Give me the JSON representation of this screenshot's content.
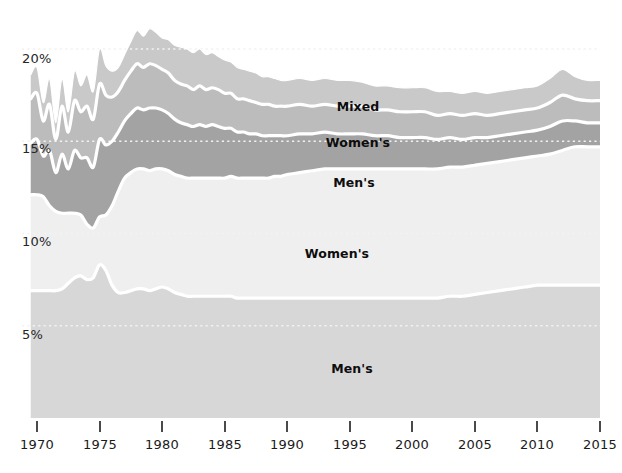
{
  "chart_data": {
    "type": "area",
    "title": "",
    "subtitle": "",
    "xlabel": "",
    "ylabel": "",
    "stacked": true,
    "grid": true,
    "legend_position": "inline-labels",
    "xlim": [
      1969,
      2016
    ],
    "ylim": [
      0,
      22
    ],
    "x_tick_labels": [
      "1970",
      "1975",
      "1980",
      "1985",
      "1990",
      "1995",
      "2000",
      "2005",
      "2010",
      "2015"
    ],
    "x_ticks": [
      1970,
      1975,
      1980,
      1985,
      1990,
      1995,
      2000,
      2005,
      2010,
      2015
    ],
    "y_tick_labels": [
      "5%",
      "10%",
      "15%",
      "20%"
    ],
    "y_ticks": [
      5,
      10,
      15,
      20
    ],
    "colors": {
      "mens_bottom": "#d7d7d7",
      "womens_light": "#efefef",
      "mens_dark": "#a3a3a3",
      "womens_mid": "#bcbcbc",
      "mixed_top": "#c9c9c9",
      "separator": "#ffffff",
      "gridline": "#f2f2f2",
      "axis_text": "#1a1a1a",
      "tick_mark": "#4a4a4a"
    },
    "x": [
      1969.5,
      1970,
      1970.5,
      1971,
      1971.5,
      1972,
      1972.5,
      1973,
      1973.5,
      1974,
      1974.5,
      1975,
      1975.5,
      1976,
      1976.5,
      1977,
      1977.5,
      1978,
      1978.5,
      1979,
      1979.5,
      1980,
      1980.5,
      1981,
      1981.5,
      1982,
      1982.5,
      1983,
      1983.5,
      1984,
      1984.5,
      1985,
      1985.5,
      1986,
      1986.5,
      1987,
      1987.5,
      1988,
      1988.5,
      1989,
      1989.5,
      1990,
      1991,
      1992,
      1993,
      1994,
      1995,
      1996,
      1997,
      1998,
      1999,
      2000,
      2001,
      2002,
      2003,
      2004,
      2005,
      2006,
      2007,
      2008,
      2009,
      2010,
      2011,
      2012,
      2013,
      2014,
      2015,
      2015.5
    ],
    "series": [
      {
        "name": "Men's",
        "label": "Men's",
        "color": "#d7d7d7",
        "order": 1,
        "values": [
          6.9,
          6.9,
          6.9,
          6.9,
          6.9,
          7.0,
          7.3,
          7.6,
          7.7,
          7.5,
          7.6,
          8.3,
          8.0,
          7.2,
          6.8,
          6.8,
          6.9,
          7.0,
          7.0,
          6.9,
          7.0,
          7.1,
          7.0,
          6.8,
          6.7,
          6.6,
          6.6,
          6.6,
          6.6,
          6.6,
          6.6,
          6.6,
          6.6,
          6.5,
          6.5,
          6.5,
          6.5,
          6.5,
          6.5,
          6.5,
          6.5,
          6.5,
          6.5,
          6.5,
          6.5,
          6.5,
          6.5,
          6.5,
          6.5,
          6.5,
          6.5,
          6.5,
          6.5,
          6.5,
          6.6,
          6.6,
          6.7,
          6.8,
          6.9,
          7.0,
          7.1,
          7.2,
          7.2,
          7.2,
          7.2,
          7.2,
          7.2,
          7.2
        ]
      },
      {
        "name": "Women's",
        "label": "Women's",
        "color": "#efefef",
        "order": 2,
        "values": [
          5.2,
          5.2,
          5.1,
          4.6,
          4.3,
          4.1,
          3.8,
          3.5,
          3.3,
          3.0,
          2.7,
          2.6,
          3.0,
          4.3,
          5.5,
          6.2,
          6.4,
          6.5,
          6.5,
          6.5,
          6.5,
          6.4,
          6.4,
          6.4,
          6.4,
          6.4,
          6.4,
          6.4,
          6.4,
          6.4,
          6.4,
          6.4,
          6.5,
          6.5,
          6.5,
          6.5,
          6.5,
          6.5,
          6.5,
          6.6,
          6.6,
          6.7,
          6.8,
          6.9,
          7.0,
          7.0,
          7.0,
          7.0,
          7.0,
          7.0,
          7.0,
          7.0,
          7.0,
          7.0,
          7.0,
          7.0,
          7.0,
          7.0,
          7.0,
          7.0,
          7.0,
          7.0,
          7.1,
          7.3,
          7.5,
          7.5,
          7.5,
          7.5
        ]
      },
      {
        "name": "Men's",
        "label": "Men's",
        "color": "#a3a3a3",
        "order": 3,
        "values": [
          2.8,
          3.0,
          2.2,
          3.0,
          2.1,
          3.2,
          2.4,
          3.4,
          3.1,
          3.6,
          3.3,
          4.2,
          3.8,
          3.5,
          3.2,
          3.1,
          3.2,
          3.3,
          3.2,
          3.4,
          3.3,
          3.2,
          3.1,
          3.0,
          2.9,
          2.9,
          2.8,
          2.9,
          2.8,
          2.9,
          2.8,
          2.7,
          2.6,
          2.5,
          2.5,
          2.4,
          2.4,
          2.3,
          2.3,
          2.2,
          2.2,
          2.1,
          2.1,
          2.0,
          2.0,
          1.9,
          1.9,
          1.9,
          1.8,
          1.8,
          1.7,
          1.7,
          1.7,
          1.6,
          1.6,
          1.5,
          1.5,
          1.4,
          1.4,
          1.4,
          1.4,
          1.4,
          1.5,
          1.6,
          1.4,
          1.3,
          1.3,
          1.3
        ]
      },
      {
        "name": "Women's",
        "label": "Women's",
        "color": "#bcbcbc",
        "order": 4,
        "values": [
          2.4,
          2.5,
          1.9,
          2.5,
          1.8,
          2.6,
          2.0,
          2.7,
          2.5,
          2.8,
          2.6,
          3.0,
          2.7,
          2.4,
          2.2,
          2.2,
          2.3,
          2.4,
          2.3,
          2.4,
          2.3,
          2.2,
          2.2,
          2.1,
          2.1,
          2.1,
          2.0,
          2.1,
          2.0,
          2.0,
          2.0,
          1.9,
          1.9,
          1.8,
          1.8,
          1.8,
          1.7,
          1.7,
          1.7,
          1.6,
          1.6,
          1.6,
          1.6,
          1.5,
          1.5,
          1.5,
          1.5,
          1.5,
          1.4,
          1.4,
          1.4,
          1.4,
          1.4,
          1.3,
          1.3,
          1.3,
          1.3,
          1.2,
          1.2,
          1.2,
          1.2,
          1.2,
          1.3,
          1.4,
          1.2,
          1.2,
          1.2,
          1.2
        ]
      },
      {
        "name": "Mixed",
        "label": "Mixed",
        "color": "#c9c9c9",
        "order": 5,
        "values": [
          1.3,
          1.4,
          1.0,
          1.4,
          0.9,
          1.5,
          1.1,
          1.6,
          1.4,
          1.7,
          1.5,
          1.9,
          1.6,
          1.4,
          1.3,
          1.4,
          1.6,
          1.8,
          1.7,
          1.9,
          1.8,
          1.7,
          1.8,
          1.9,
          2.0,
          2.0,
          2.0,
          2.0,
          1.9,
          1.9,
          1.8,
          1.8,
          1.7,
          1.7,
          1.6,
          1.6,
          1.6,
          1.5,
          1.5,
          1.5,
          1.4,
          1.4,
          1.4,
          1.4,
          1.4,
          1.4,
          1.4,
          1.3,
          1.3,
          1.3,
          1.3,
          1.3,
          1.3,
          1.3,
          1.2,
          1.2,
          1.2,
          1.2,
          1.2,
          1.2,
          1.2,
          1.2,
          1.3,
          1.4,
          1.2,
          1.1,
          1.1,
          1.1
        ]
      }
    ],
    "inline_labels": [
      {
        "text": "Mixed",
        "x_px": 358,
        "y_px": 107
      },
      {
        "text": "Women's",
        "x_px": 358,
        "y_px": 143
      },
      {
        "text": "Men's",
        "x_px": 354,
        "y_px": 183
      },
      {
        "text": "Women's",
        "x_px": 337,
        "y_px": 254
      },
      {
        "text": "Men's",
        "x_px": 352,
        "y_px": 369
      }
    ]
  },
  "axis": {
    "y_labels": [
      {
        "text": "20%",
        "y_px": 60
      },
      {
        "text": "15%",
        "y_px": 150
      },
      {
        "text": "10%",
        "y_px": 243
      },
      {
        "text": "5%",
        "y_px": 336
      }
    ],
    "x_labels": [
      {
        "text": "1970",
        "x_px": 37
      },
      {
        "text": "1975",
        "x_px": 100
      },
      {
        "text": "1980",
        "x_px": 162
      },
      {
        "text": "1985",
        "x_px": 225
      },
      {
        "text": "1990",
        "x_px": 287
      },
      {
        "text": "1995",
        "x_px": 350
      },
      {
        "text": "2000",
        "x_px": 412
      },
      {
        "text": "2005",
        "x_px": 475
      },
      {
        "text": "2010",
        "x_px": 537
      },
      {
        "text": "2015",
        "x_px": 600
      }
    ]
  }
}
